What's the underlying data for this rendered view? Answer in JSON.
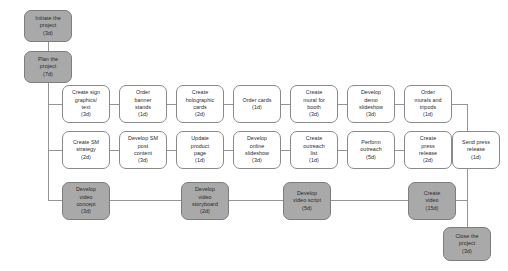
{
  "diagram": {
    "type": "project-network-flowchart",
    "title": "",
    "colors": {
      "node_fill_plain": "#ffffff",
      "node_fill_highlight": "#a9a9a9",
      "node_border": "#8a8a8a",
      "edge": "#8a8a8a",
      "text": "#2b2b2b",
      "background": "#ffffff"
    },
    "nodes": [
      {
        "id": "initiate",
        "label": "Initiate the\nproject\n(3d)",
        "duration": "3d",
        "style": "highlight",
        "x": 24,
        "y": 10,
        "w": 48,
        "h": 32
      },
      {
        "id": "plan",
        "label": "Plan the\nproject\n(7d)",
        "duration": "7d",
        "style": "highlight",
        "x": 24,
        "y": 51,
        "w": 48,
        "h": 32
      },
      {
        "id": "sign_graphics",
        "label": "Create sign\ngraphics/\ntext\n(3d)",
        "duration": "3d",
        "style": "plain",
        "x": 62,
        "y": 85,
        "w": 48,
        "h": 38
      },
      {
        "id": "banner_stands",
        "label": "Order\nbanner\nstands\n(1d)",
        "duration": "1d",
        "style": "plain",
        "x": 119,
        "y": 85,
        "w": 48,
        "h": 38
      },
      {
        "id": "holographic",
        "label": "Create\nholographic\ncards\n(2d)",
        "duration": "2d",
        "style": "plain",
        "x": 176,
        "y": 85,
        "w": 48,
        "h": 38
      },
      {
        "id": "order_cards",
        "label": "Order cards\n(1d)",
        "duration": "1d",
        "style": "plain",
        "x": 233,
        "y": 85,
        "w": 48,
        "h": 38
      },
      {
        "id": "mural_booth",
        "label": "Create\nmural for\nbooth\n(3d)",
        "duration": "3d",
        "style": "plain",
        "x": 290,
        "y": 85,
        "w": 48,
        "h": 38
      },
      {
        "id": "demo_slideshow",
        "label": "Develop\ndemo\nslideshow\n(3d)",
        "duration": "3d",
        "style": "plain",
        "x": 347,
        "y": 85,
        "w": 48,
        "h": 38
      },
      {
        "id": "order_murals",
        "label": "Order\nmurals and\ntripods\n(1d)",
        "duration": "1d",
        "style": "plain",
        "x": 404,
        "y": 85,
        "w": 48,
        "h": 38
      },
      {
        "id": "sm_strategy",
        "label": "Create SM\nstrategy\n(2d)",
        "duration": "2d",
        "style": "plain",
        "x": 62,
        "y": 131,
        "w": 48,
        "h": 38
      },
      {
        "id": "sm_post",
        "label": "Develop SM\npost\ncontent\n(3d)",
        "duration": "3d",
        "style": "plain",
        "x": 119,
        "y": 131,
        "w": 48,
        "h": 38
      },
      {
        "id": "product_page",
        "label": "Update\nproduct\npage\n(1d)",
        "duration": "1d",
        "style": "plain",
        "x": 176,
        "y": 131,
        "w": 48,
        "h": 38
      },
      {
        "id": "online_slides",
        "label": "Develop\nonline\nslideshow\n(3d)",
        "duration": "3d",
        "style": "plain",
        "x": 233,
        "y": 131,
        "w": 48,
        "h": 38
      },
      {
        "id": "outreach_list",
        "label": "Create\noutreach\nlist\n(1d)",
        "duration": "1d",
        "style": "plain",
        "x": 290,
        "y": 131,
        "w": 48,
        "h": 38
      },
      {
        "id": "perform_out",
        "label": "Perform\noutreach\n(5d)",
        "duration": "5d",
        "style": "plain",
        "x": 347,
        "y": 131,
        "w": 48,
        "h": 38
      },
      {
        "id": "press_release",
        "label": "Create\npress\nrelease\n(2d)",
        "duration": "2d",
        "style": "plain",
        "x": 404,
        "y": 131,
        "w": 48,
        "h": 38
      },
      {
        "id": "send_press",
        "label": "Send press\nrelease\n(1d)",
        "duration": "1d",
        "style": "plain",
        "x": 452,
        "y": 131,
        "w": 48,
        "h": 38
      },
      {
        "id": "video_concept",
        "label": "Develop\nvideo\nconcept\n(3d)",
        "duration": "3d",
        "style": "highlight",
        "x": 62,
        "y": 182,
        "w": 48,
        "h": 38
      },
      {
        "id": "video_story",
        "label": "Develop\nvideo\nstoryboard\n(2d)",
        "duration": "2d",
        "style": "highlight",
        "x": 181,
        "y": 182,
        "w": 48,
        "h": 38
      },
      {
        "id": "video_script",
        "label": "Develop\nvideo script\n(5d)",
        "duration": "5d",
        "style": "highlight",
        "x": 283,
        "y": 182,
        "w": 48,
        "h": 38
      },
      {
        "id": "create_video",
        "label": "Create\nvideo\n(15d)",
        "duration": "15d",
        "style": "highlight",
        "x": 408,
        "y": 182,
        "w": 48,
        "h": 38
      },
      {
        "id": "close",
        "label": "Close the\nproject\n(3d)",
        "duration": "3d",
        "style": "highlight",
        "x": 443,
        "y": 227,
        "w": 48,
        "h": 34
      }
    ],
    "edges": [
      {
        "from": "initiate",
        "to": "plan",
        "kind": "vertical"
      },
      {
        "from": "plan",
        "to": "sign_graphics",
        "kind": "branch-down-right"
      },
      {
        "from": "plan",
        "to": "sm_strategy",
        "kind": "branch-down-right"
      },
      {
        "from": "plan",
        "to": "video_concept",
        "kind": "branch-down-right"
      },
      {
        "from": "sign_graphics",
        "to": "banner_stands",
        "kind": "horizontal"
      },
      {
        "from": "banner_stands",
        "to": "holographic",
        "kind": "horizontal"
      },
      {
        "from": "holographic",
        "to": "order_cards",
        "kind": "horizontal"
      },
      {
        "from": "order_cards",
        "to": "mural_booth",
        "kind": "horizontal"
      },
      {
        "from": "mural_booth",
        "to": "demo_slideshow",
        "kind": "horizontal"
      },
      {
        "from": "demo_slideshow",
        "to": "order_murals",
        "kind": "horizontal"
      },
      {
        "from": "sm_strategy",
        "to": "sm_post",
        "kind": "horizontal"
      },
      {
        "from": "sm_post",
        "to": "product_page",
        "kind": "horizontal"
      },
      {
        "from": "product_page",
        "to": "online_slides",
        "kind": "horizontal"
      },
      {
        "from": "online_slides",
        "to": "outreach_list",
        "kind": "horizontal"
      },
      {
        "from": "outreach_list",
        "to": "perform_out",
        "kind": "horizontal"
      },
      {
        "from": "perform_out",
        "to": "press_release",
        "kind": "horizontal"
      },
      {
        "from": "press_release",
        "to": "send_press",
        "kind": "horizontal"
      },
      {
        "from": "video_concept",
        "to": "video_story",
        "kind": "horizontal"
      },
      {
        "from": "video_story",
        "to": "video_script",
        "kind": "horizontal"
      },
      {
        "from": "video_script",
        "to": "create_video",
        "kind": "horizontal"
      },
      {
        "from": "order_murals",
        "to": "close",
        "kind": "merge-right-down"
      },
      {
        "from": "send_press",
        "to": "close",
        "kind": "merge-right-down"
      },
      {
        "from": "create_video",
        "to": "close",
        "kind": "merge-right-down"
      }
    ]
  }
}
